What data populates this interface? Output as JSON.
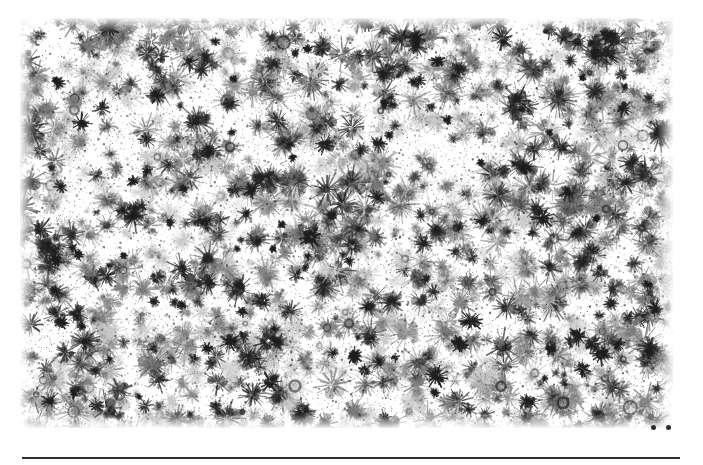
{
  "page": {
    "width": 703,
    "height": 465,
    "background_color": "#ffffff"
  },
  "plate": {
    "name": "texture-field",
    "description": "Dense allover field of radial starburst splatter clusters in grayscale on white",
    "left": 20,
    "top": 18,
    "width": 653,
    "height": 410,
    "ink_color": "#1e1e1e",
    "mid_tone_color": "#7a7a7a",
    "light_tone_color": "#c9c9c9",
    "paper_color": "#ffffff",
    "cluster_count": 1400,
    "seed": 20240517
  },
  "stray_marks": [
    {
      "name": "stray-dot-left",
      "x": 651,
      "y": 425,
      "size": 5,
      "color": "#2b2b2b"
    },
    {
      "name": "stray-dot-right",
      "x": 666,
      "y": 425,
      "size": 5,
      "color": "#2b2b2b"
    }
  ],
  "bottom_rule": {
    "name": "horizontal-rule",
    "left": 22,
    "top": 457,
    "width": 658,
    "height": 2,
    "color": "#303030"
  },
  "chart_data": {
    "type": "heatmap",
    "title": "",
    "xlabel": "",
    "ylabel": "",
    "grid": false,
    "legend": null,
    "colormap": "grayscale",
    "value_range": [
      0,
      1
    ]
  }
}
